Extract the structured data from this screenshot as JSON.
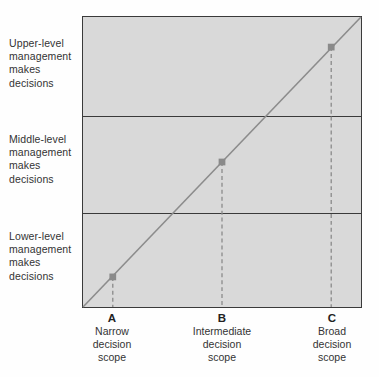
{
  "figure": {
    "name": "decision-scope-vs-management-level",
    "colors": {
      "plot_fill": "#d9d9d9",
      "plot_border": "#3a3a3a",
      "divider": "#3a3a3a",
      "trend_line": "#8c8c8c",
      "marker": "#8a8a8a",
      "drop_line": "#8a8a8a",
      "text": "#333333"
    }
  },
  "bands": [
    {
      "id": "upper",
      "label": "Upper-level\nmanagement\nmakes\ndecisions"
    },
    {
      "id": "middle",
      "label": "Middle-level\nmanagement\nmakes\ndecisions"
    },
    {
      "id": "lower",
      "label": "Lower-level\nmanagement\nmakes\ndecisions"
    }
  ],
  "ticks": [
    {
      "letter": "A",
      "line1": "Narrow",
      "line2": "decision",
      "line3": "scope"
    },
    {
      "letter": "B",
      "line1": "Intermediate",
      "line2": "decision",
      "line3": "scope"
    },
    {
      "letter": "C",
      "line1": "Broad",
      "line2": "decision",
      "line3": "scope"
    }
  ],
  "chart_data": {
    "type": "line",
    "title": "",
    "xlabel": "",
    "ylabel": "",
    "x": [
      "A",
      "B",
      "C"
    ],
    "x_tick_labels": [
      "Narrow decision scope",
      "Intermediate decision scope",
      "Broad decision scope"
    ],
    "y_band_labels": [
      "Lower-level management makes decisions",
      "Middle-level management makes decisions",
      "Upper-level management makes decisions"
    ],
    "y_band_boundaries_pct": [
      33,
      66
    ],
    "xlim": [
      0,
      100
    ],
    "ylim": [
      0,
      100
    ],
    "grid": false,
    "legend": null,
    "series": [
      {
        "name": "Decision scope vs management level",
        "description": "Linear relationship from bottom-left to top-right",
        "x": [
          0,
          100
        ],
        "values": [
          0,
          100
        ]
      }
    ],
    "markers": [
      {
        "label": "A",
        "x": 10.7,
        "y": 10.7,
        "band": "Lower-level management makes decisions"
      },
      {
        "label": "B",
        "x": 50.0,
        "y": 50.0,
        "band": "Middle-level management makes decisions"
      },
      {
        "label": "C",
        "x": 89.3,
        "y": 89.3,
        "band": "Upper-level management makes decisions"
      }
    ],
    "annotations": [
      "Dashed drop lines connect each marker down to the x-axis"
    ]
  }
}
